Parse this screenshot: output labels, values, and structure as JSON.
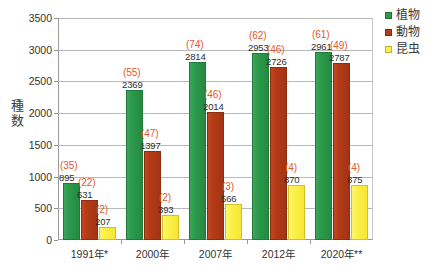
{
  "chart_data": {
    "type": "bar",
    "title": "",
    "subtitle": "",
    "xlabel": "",
    "ylabel": "種数",
    "ylim": [
      0,
      3500
    ],
    "ytick_step": 500,
    "yticks": [
      "3500",
      "3000",
      "2500",
      "2000",
      "1500",
      "1000",
      "500",
      "0"
    ],
    "grid": true,
    "legend_position": "top-right",
    "categories": [
      "1991年*",
      "2000年",
      "2007年",
      "2012年",
      "2020年**"
    ],
    "series": [
      {
        "name": "植物",
        "color": "#2d9a4d",
        "values": [
          895,
          2369,
          2814,
          2953,
          2961
        ],
        "annotations": [
          "(35)",
          "(55)",
          "(74)",
          "(62)",
          "(61)"
        ]
      },
      {
        "name": "動物",
        "color": "#b33a17",
        "values": [
          631,
          1397,
          2014,
          2726,
          2787
        ],
        "annotations": [
          "(22)",
          "(47)",
          "(46)",
          "(46)",
          "(49)"
        ]
      },
      {
        "name": "昆虫",
        "color": "#fbf04a",
        "values": [
          207,
          393,
          566,
          870,
          875
        ],
        "annotations": [
          "(2)",
          "(2)",
          "(3)",
          "(4)",
          "(4)"
        ]
      }
    ],
    "annotation_color": "#e0592a",
    "value_label_color": "#2e2e2e"
  },
  "legend": {
    "items": [
      {
        "label": "植物",
        "color": "#2d9a4d"
      },
      {
        "label": "動物",
        "color": "#b33a17"
      },
      {
        "label": "昆虫",
        "color": "#fbf04a"
      }
    ]
  },
  "axis": {
    "y_title_chars": [
      "種",
      "数"
    ]
  }
}
